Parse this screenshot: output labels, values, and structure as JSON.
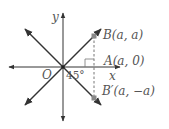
{
  "diagram": {
    "type": "coordinate-geometry",
    "axes": {
      "x_label": "x",
      "y_label": "y",
      "origin_label": "O"
    },
    "points": [
      {
        "id": "B",
        "label": "B(a, a)",
        "coords": [
          "a",
          "a"
        ]
      },
      {
        "id": "A",
        "label": "A(a, 0)",
        "coords": [
          "a",
          "0"
        ]
      },
      {
        "id": "B_prime",
        "label": "B′(a, −a)",
        "coords": [
          "a",
          "-a"
        ]
      }
    ],
    "angle_label": "45°",
    "lines": [
      {
        "name": "y = x",
        "style": "solid"
      },
      {
        "name": "y = -x",
        "style": "solid"
      },
      {
        "name": "x = a",
        "style": "dashed",
        "from": "B",
        "to": "B_prime"
      }
    ],
    "right_angle_marker_at": "A",
    "colors": {
      "line": "#333333",
      "label": "#555555",
      "point": "#888888",
      "dashed": "#666666"
    }
  }
}
